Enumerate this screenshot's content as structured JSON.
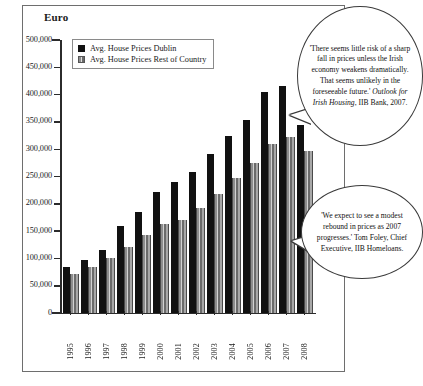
{
  "chart_data": {
    "type": "bar",
    "title": "Euro",
    "xlabel": "",
    "ylabel": "Euro",
    "ylim": [
      0,
      500000
    ],
    "ytick_step": 50000,
    "grid": false,
    "legend_position": "top-left inside",
    "categories": [
      "1995",
      "1996",
      "1997",
      "1998",
      "1999",
      "2000",
      "2001",
      "2002",
      "2003",
      "2004",
      "2005",
      "2006",
      "2007",
      "2008"
    ],
    "ytick_labels": [
      "0",
      "50,000",
      "100,000",
      "150,000",
      "200,000",
      "250,000",
      "300,000",
      "350,000",
      "400,000",
      "450,000",
      "500,000"
    ],
    "series": [
      {
        "name": "Avg. House Prices Dublin",
        "color": "#111111",
        "values": [
          85000,
          97000,
          115000,
          160000,
          185000,
          222000,
          240000,
          258000,
          292000,
          325000,
          353000,
          405000,
          415000,
          345000
        ]
      },
      {
        "name": "Avg. House Prices Rest of Country",
        "color": "#8d8d8d",
        "values": [
          72000,
          85000,
          100000,
          120000,
          142000,
          163000,
          170000,
          193000,
          218000,
          248000,
          275000,
          310000,
          322000,
          297000
        ]
      }
    ]
  },
  "legend": {
    "items": [
      {
        "label": "Avg. House Prices Dublin",
        "swatch": "black-square"
      },
      {
        "label": "Avg. House Prices Rest of Country",
        "swatch": "hatched-square"
      }
    ]
  },
  "annotations": [
    {
      "id": "bubble-1",
      "text_parts": [
        {
          "text": "'There seems little risk of a sharp fall in prices unless the Irish economy weakens dramatically.  That seems unlikely in the foreseeable future.' ",
          "style": "normal"
        },
        {
          "text": "Outlook for Irish Housing",
          "style": "italic"
        },
        {
          "text": ", IIB Bank, 2007.",
          "style": "normal"
        }
      ],
      "plain_text": "'There seems little risk of a sharp fall in prices unless the Irish economy weakens dramatically. That seems unlikely in the foreseeable future.' Outlook for Irish Housing, IIB Bank, 2007."
    },
    {
      "id": "bubble-2",
      "text_parts": [
        {
          "text": "'We expect to see a modest rebound in prices as 2007 progresses.' Tom Foley, Chief Executive, IIB Homeloans.",
          "style": "normal"
        }
      ],
      "plain_text": "'We expect to see a modest rebound in prices as 2007 progresses.' Tom Foley, Chief Executive, IIB Homeloans."
    }
  ],
  "colors": {
    "dublin_bar": "#111111",
    "rest_bar": "#8d8d8d",
    "axis": "#2b2b2b",
    "frame_border": "#6e6e6e",
    "background": "#ffffff"
  }
}
